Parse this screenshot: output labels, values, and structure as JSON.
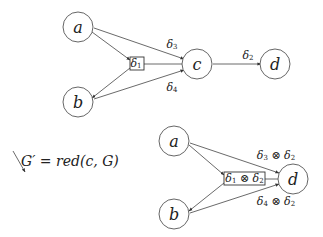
{
  "top_graph": {
    "nodes": {
      "a": "a",
      "b": "b",
      "c": "c",
      "d": "d"
    },
    "box_label": {
      "sym": "δ",
      "sub": "1"
    },
    "edge_labels": {
      "ac": {
        "sym": "δ",
        "sub": "3"
      },
      "bc": {
        "sym": "δ",
        "sub": "4"
      },
      "cd": {
        "sym": "δ",
        "sub": "2"
      }
    }
  },
  "transform": {
    "lhs": "G′",
    "eq": " = ",
    "rhs": "red(c, G)"
  },
  "bottom_graph": {
    "nodes": {
      "a": "a",
      "b": "b",
      "d": "d"
    },
    "box_label": {
      "sym1": "δ",
      "sub1": "1",
      "op": " ⊗ ",
      "sym2": "δ",
      "sub2": "2"
    },
    "edge_labels": {
      "ad": {
        "sym1": "δ",
        "sub1": "3",
        "op": " ⊗ ",
        "sym2": "δ",
        "sub2": "2"
      },
      "bd": {
        "sym1": "δ",
        "sub1": "4",
        "op": " ⊗ ",
        "sym2": "δ",
        "sub2": "2"
      }
    }
  }
}
